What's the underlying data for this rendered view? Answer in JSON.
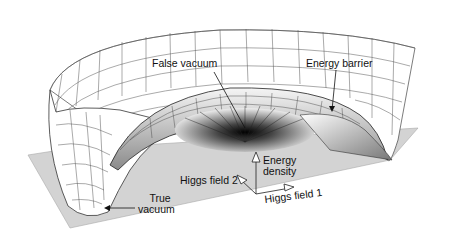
{
  "figure": {
    "type": "3D energy surface diagram",
    "colors": {
      "plane": "#d3d3d3",
      "surface": "#ffffff",
      "grid": "#333333",
      "text": "#111111"
    }
  },
  "labels": {
    "false_vacuum": "False vacuum",
    "energy_barrier": "Energy barrier",
    "true_vacuum_line1": "True",
    "true_vacuum_line2": "vacuum",
    "higgs_field_2": "Higgs field 2",
    "energy_density_line1": "Energy",
    "energy_density_line2": "density",
    "higgs_field_1": "Higgs field 1"
  },
  "axes": [
    {
      "name": "Energy density",
      "direction": "up"
    },
    {
      "name": "Higgs field 1",
      "direction": "right"
    },
    {
      "name": "Higgs field 2",
      "direction": "back-left"
    }
  ]
}
